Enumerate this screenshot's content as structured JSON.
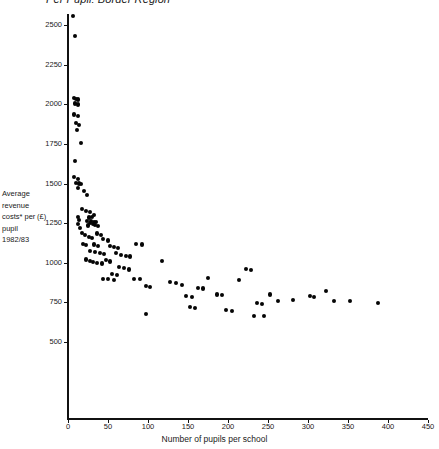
{
  "chart_data": {
    "type": "scatter",
    "title": "Per Pupil: Border Region",
    "xlabel": "Number of pupils per school",
    "ylabel": "Average revenue costs* per pupil 1982/83",
    "ylabel_unit": "(£)",
    "xlim": [
      0,
      465
    ],
    "ylim": [
      400,
      2600
    ],
    "xticks": [
      0,
      50,
      100,
      150,
      200,
      250,
      300,
      350,
      400,
      450
    ],
    "yticks": [
      500,
      750,
      1000,
      1250,
      1500,
      1750,
      2000,
      2250,
      2500
    ],
    "grid": false,
    "legend": null,
    "marker": "filled-circle",
    "marker_color": "#050505",
    "points": [
      [
        6,
        2555
      ],
      [
        9,
        2430
      ],
      [
        7,
        2040
      ],
      [
        10,
        2035
      ],
      [
        12,
        2030
      ],
      [
        9,
        2005
      ],
      [
        13,
        1998
      ],
      [
        8,
        1935
      ],
      [
        12,
        1925
      ],
      [
        10,
        1880
      ],
      [
        14,
        1870
      ],
      [
        11,
        1840
      ],
      [
        16,
        1755
      ],
      [
        9,
        1640
      ],
      [
        8,
        1540
      ],
      [
        12,
        1530
      ],
      [
        10,
        1505
      ],
      [
        14,
        1500
      ],
      [
        16,
        1495
      ],
      [
        13,
        1470
      ],
      [
        20,
        1455
      ],
      [
        24,
        1425
      ],
      [
        17,
        1340
      ],
      [
        12,
        1290
      ],
      [
        14,
        1270
      ],
      [
        13,
        1245
      ],
      [
        15,
        1220
      ],
      [
        22,
        1325
      ],
      [
        28,
        1320
      ],
      [
        33,
        1300
      ],
      [
        30,
        1290
      ],
      [
        26,
        1285
      ],
      [
        24,
        1265
      ],
      [
        29,
        1262
      ],
      [
        32,
        1258
      ],
      [
        35,
        1255
      ],
      [
        27,
        1250
      ],
      [
        31,
        1245
      ],
      [
        34,
        1240
      ],
      [
        25,
        1235
      ],
      [
        38,
        1232
      ],
      [
        18,
        1190
      ],
      [
        21,
        1175
      ],
      [
        26,
        1165
      ],
      [
        30,
        1155
      ],
      [
        36,
        1185
      ],
      [
        41,
        1175
      ],
      [
        19,
        1120
      ],
      [
        23,
        1110
      ],
      [
        33,
        1115
      ],
      [
        38,
        1105
      ],
      [
        44,
        1150
      ],
      [
        50,
        1140
      ],
      [
        28,
        1075
      ],
      [
        34,
        1068
      ],
      [
        40,
        1060
      ],
      [
        45,
        1055
      ],
      [
        52,
        1105
      ],
      [
        58,
        1100
      ],
      [
        63,
        1095
      ],
      [
        22,
        1020
      ],
      [
        27,
        1010
      ],
      [
        31,
        1005
      ],
      [
        36,
        1000
      ],
      [
        42,
        995
      ],
      [
        47,
        1015
      ],
      [
        53,
        1008
      ],
      [
        60,
        1060
      ],
      [
        66,
        1050
      ],
      [
        72,
        1045
      ],
      [
        78,
        1040
      ],
      [
        85,
        1120
      ],
      [
        92,
        1115
      ],
      [
        64,
        975
      ],
      [
        70,
        965
      ],
      [
        76,
        958
      ],
      [
        55,
        930
      ],
      [
        61,
        925
      ],
      [
        44,
        900
      ],
      [
        50,
        895
      ],
      [
        57,
        890
      ],
      [
        83,
        900
      ],
      [
        90,
        895
      ],
      [
        97,
        855
      ],
      [
        103,
        848
      ],
      [
        98,
        675
      ],
      [
        118,
        1010
      ],
      [
        128,
        880
      ],
      [
        135,
        870
      ],
      [
        142,
        862
      ],
      [
        148,
        790
      ],
      [
        155,
        785
      ],
      [
        162,
        840
      ],
      [
        169,
        838
      ],
      [
        152,
        720
      ],
      [
        159,
        715
      ],
      [
        175,
        905
      ],
      [
        186,
        800
      ],
      [
        193,
        795
      ],
      [
        198,
        700
      ],
      [
        205,
        695
      ],
      [
        214,
        890
      ],
      [
        222,
        960
      ],
      [
        229,
        955
      ],
      [
        236,
        745
      ],
      [
        243,
        740
      ],
      [
        232,
        665
      ],
      [
        245,
        662
      ],
      [
        253,
        800
      ],
      [
        262,
        760
      ],
      [
        281,
        765
      ],
      [
        302,
        790
      ],
      [
        308,
        785
      ],
      [
        323,
        820
      ],
      [
        332,
        760
      ],
      [
        352,
        760
      ],
      [
        388,
        745
      ],
      [
        455,
        790
      ]
    ]
  }
}
